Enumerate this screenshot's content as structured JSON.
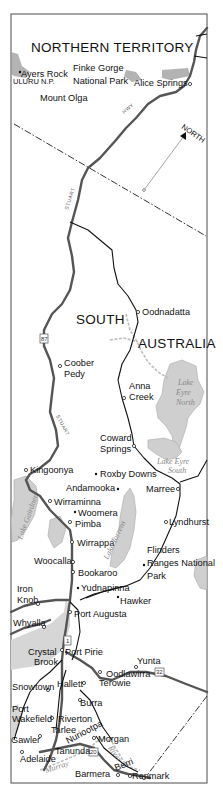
{
  "map": {
    "regions": {
      "northern_territory": "NORTHERN TERRITORY",
      "south": "SOUTH",
      "australia": "AUSTRALIA"
    },
    "compass": {
      "label": "NORTH"
    },
    "highways": {
      "hwy_label": "HWY",
      "stuart_label": "STUART",
      "shields": [
        "87",
        "1",
        "32",
        "20"
      ]
    },
    "places": {
      "ayers_rock": "Ayers Rock",
      "uluru_np": "ULURU N.P.",
      "mount_olga": "Mount Olga",
      "finke_gorge_1": "Finke Gorge",
      "finke_gorge_2": "National Park",
      "alice_springs": "Alice Springs",
      "oodnadatta": "Oodnadatta",
      "coober_1": "Coober",
      "coober_2": "Pedy",
      "anna_1": "Anna",
      "anna_2": "Creek",
      "coward_1": "Coward",
      "coward_2": "Springs",
      "kingoonya": "Kingoonya",
      "roxby_downs": "Roxby Downs",
      "andamooka": "Andamooka",
      "marree": "Marree",
      "wirraminna": "Wirraminna",
      "woomera": "Woomera",
      "pimba": "Pimba",
      "lyndhurst": "Lyndhurst",
      "wirrappa": "Wirrappa",
      "flinders_1": "Flinders",
      "flinders_2": "Ranges National",
      "flinders_3": "Park",
      "woocalla": "Woocalla",
      "bookaroo": "Bookaroo",
      "yudnapinna": "Yudnapinna",
      "hawker": "Hawker",
      "iron_1": "Iron",
      "iron_2": "Knob",
      "port_augusta": "Port Augusta",
      "whyalla": "Whyalla",
      "crystal_1": "Crystal",
      "crystal_2": "Brook",
      "port_pirie": "Port Pirie",
      "yunta": "Yunta",
      "oodlawirra": "Oodlawirra",
      "snowtown": "Snowtown",
      "hallett": "Hallett",
      "terowie": "Terowie",
      "burra": "Burra",
      "port_wakefield_1": "Port",
      "port_wakefield_2": "Wakefield",
      "riverton": "Riverton",
      "tarlee": "Tarlee",
      "nuriootpa": "Nuriootpa",
      "gawler": "Gawler",
      "morgan": "Morgan",
      "tanunda": "Tanunda",
      "adelaide": "Adelaide",
      "barmera": "Barmera",
      "berri": "Berri",
      "renmark": "Renmark"
    },
    "lakes": {
      "eyre_north_1": "Lake",
      "eyre_north_2": "Eyre",
      "eyre_north_3": "North",
      "eyre_south_1": "Lake Eyre",
      "eyre_south_2": "South",
      "gairdner": "Lake Gairdner",
      "torrens": "Lake Torrens",
      "murray": "Murray",
      "river": "River"
    }
  }
}
